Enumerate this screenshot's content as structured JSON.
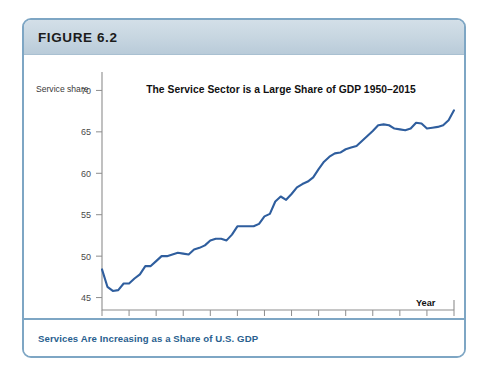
{
  "figure": {
    "label": "FIGURE 6.2",
    "caption": "Services Are Increasing as a Share of U.S. GDP",
    "border_color": "#7ea6c4",
    "header_color": "#c6d5e0",
    "caption_color": "#2a5f8f"
  },
  "chart_data": {
    "type": "line",
    "title": "The Service Sector is a Large Share of GDP 1950–2015",
    "xlabel": "Year",
    "ylabel": "Service share",
    "xlim": [
      1950,
      2015
    ],
    "ylim": [
      43.5,
      71.5
    ],
    "grid": false,
    "legend": null,
    "line_color": "#2f5e9e",
    "yticks": [
      45,
      50,
      55,
      60,
      65,
      70
    ],
    "ytick_labels": [
      "45",
      "50",
      "55",
      "60",
      "65",
      "70"
    ],
    "xticks": [
      1950,
      1955,
      1960,
      1965,
      1970,
      1975,
      1980,
      1985,
      1990,
      1995,
      2000,
      2005,
      2010,
      2015
    ],
    "xtick_labels": [
      "1950",
      "1955",
      "1960",
      "1965",
      "1970",
      "1975",
      "1980",
      "1985",
      "1990",
      "1995",
      "2000",
      "2005",
      "2010",
      "2015"
    ],
    "series": [
      {
        "name": "Service share of GDP",
        "x": [
          1950,
          1951,
          1952,
          1953,
          1954,
          1955,
          1956,
          1957,
          1958,
          1959,
          1960,
          1961,
          1962,
          1963,
          1964,
          1965,
          1966,
          1967,
          1968,
          1969,
          1970,
          1971,
          1972,
          1973,
          1974,
          1975,
          1976,
          1977,
          1978,
          1979,
          1980,
          1981,
          1982,
          1983,
          1984,
          1985,
          1986,
          1987,
          1988,
          1989,
          1990,
          1991,
          1992,
          1993,
          1994,
          1995,
          1996,
          1997,
          1998,
          1999,
          2000,
          2001,
          2002,
          2003,
          2004,
          2005,
          2006,
          2007,
          2008,
          2009,
          2010,
          2011,
          2012,
          2013,
          2014,
          2015
        ],
        "values": [
          48.4,
          46.3,
          45.8,
          45.9,
          46.7,
          46.7,
          47.3,
          47.8,
          48.8,
          48.8,
          49.4,
          50.0,
          50.0,
          50.2,
          50.4,
          50.3,
          50.2,
          50.8,
          51.0,
          51.3,
          51.9,
          52.1,
          52.1,
          51.9,
          52.6,
          53.6,
          53.6,
          53.6,
          53.6,
          53.9,
          54.8,
          55.1,
          56.6,
          57.2,
          56.8,
          57.5,
          58.3,
          58.7,
          59.0,
          59.5,
          60.5,
          61.4,
          62.0,
          62.4,
          62.5,
          62.9,
          63.1,
          63.3,
          63.9,
          64.5,
          65.1,
          65.8,
          65.9,
          65.8,
          65.4,
          65.3,
          65.2,
          65.4,
          66.1,
          66.0,
          65.4,
          65.5,
          65.6,
          65.8,
          66.4,
          67.6
        ]
      }
    ]
  }
}
